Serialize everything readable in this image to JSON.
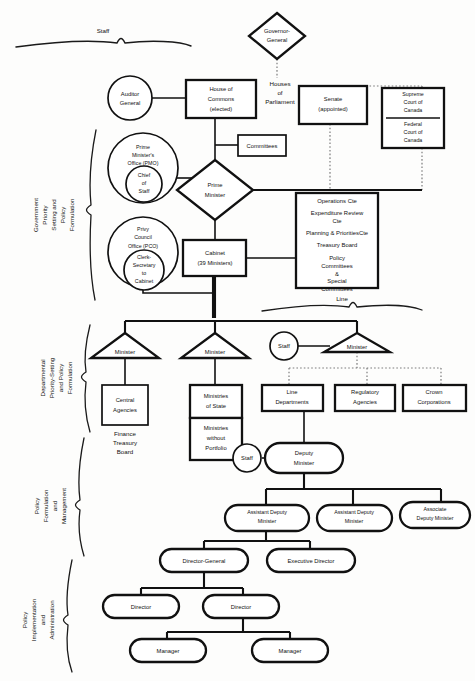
{
  "diagram": {
    "brace_labels": {
      "staff": "Staff",
      "line": "Line"
    },
    "side_labels": [
      {
        "id": "government-priority",
        "lines": [
          "Government",
          "Priority",
          "Setting and",
          "Policy",
          "Formulation"
        ]
      },
      {
        "id": "departmental-priority",
        "lines": [
          "Departmental",
          "Priority-Setting",
          "and Policy",
          "Formulation"
        ]
      },
      {
        "id": "policy-formulation-management",
        "lines": [
          "Policy",
          "Formulation",
          "and",
          "Management"
        ]
      },
      {
        "id": "policy-implementation-administration",
        "lines": [
          "Policy",
          "Implementation",
          "and",
          "Administration"
        ]
      }
    ],
    "free_labels": [
      {
        "id": "houses-of-parliament",
        "lines": [
          "Houses",
          "of",
          "Parliament"
        ]
      },
      {
        "id": "finance-treasury-board",
        "lines": [
          "Finance",
          "Treasury",
          "Board"
        ]
      }
    ],
    "nodes": [
      {
        "id": "governor-general",
        "shape": "diamond",
        "lines": [
          "Governor-",
          "General"
        ]
      },
      {
        "id": "auditor-general",
        "shape": "circle",
        "lines": [
          "Auditor",
          "General"
        ]
      },
      {
        "id": "house-of-commons",
        "shape": "rect",
        "lines": [
          "House of",
          "Commons",
          "(elected)"
        ]
      },
      {
        "id": "senate",
        "shape": "rect",
        "lines": [
          "Senate",
          "(appointed)"
        ]
      },
      {
        "id": "supreme-court",
        "shape": "rect",
        "lines": [
          "Supreme",
          "Court of",
          "Canada"
        ]
      },
      {
        "id": "federal-court",
        "shape": "rect",
        "lines": [
          "Federal",
          "Court of",
          "Canada"
        ]
      },
      {
        "id": "pmo",
        "shape": "circle",
        "lines": [
          "Prime",
          "Minister's",
          "Office (PMO)"
        ]
      },
      {
        "id": "chief-of-staff",
        "shape": "circle",
        "lines": [
          "Chief",
          "of",
          "Staff"
        ]
      },
      {
        "id": "committees",
        "shape": "rect",
        "lines": [
          "Committees"
        ]
      },
      {
        "id": "prime-minister",
        "shape": "diamond",
        "lines": [
          "Prime",
          "Minister"
        ]
      },
      {
        "id": "pco",
        "shape": "circle",
        "lines": [
          "Privy",
          "Council",
          "Office (PCO)"
        ]
      },
      {
        "id": "clerk-secretary",
        "shape": "circle",
        "lines": [
          "Clerk-",
          "Secretary",
          "to",
          "Cabinet"
        ]
      },
      {
        "id": "cabinet",
        "shape": "rect",
        "lines": [
          "Cabinet",
          "(39 Ministers)"
        ]
      },
      {
        "id": "cabinet-committees",
        "shape": "rect",
        "lines": [
          "Operations Cte",
          "Expenditure Review",
          "Cte",
          "Planning & PrioritiesCte",
          "Treasury Board",
          "",
          "Policy",
          "Committees",
          "&",
          "Special",
          "Committees"
        ]
      },
      {
        "id": "minister-central",
        "shape": "triangle",
        "lines": [
          "Minister"
        ]
      },
      {
        "id": "minister-state",
        "shape": "triangle",
        "lines": [
          "Minister"
        ]
      },
      {
        "id": "minister-line",
        "shape": "triangle",
        "lines": [
          "Minister"
        ]
      },
      {
        "id": "staff-minister",
        "shape": "circle",
        "lines": [
          "Staff"
        ]
      },
      {
        "id": "central-agencies",
        "shape": "rect",
        "lines": [
          "Central",
          "Agencies"
        ]
      },
      {
        "id": "ministries-of-state",
        "shape": "rect",
        "lines": [
          "Ministries",
          "of State"
        ]
      },
      {
        "id": "ministries-without-portfolio",
        "shape": "rect",
        "lines": [
          "Ministries",
          "without",
          "Portfolio"
        ]
      },
      {
        "id": "line-departments",
        "shape": "rect",
        "lines": [
          "Line",
          "Departments"
        ]
      },
      {
        "id": "regulatory-agencies",
        "shape": "rect",
        "lines": [
          "Regulatory",
          "Agencies"
        ]
      },
      {
        "id": "crown-corporations",
        "shape": "rect",
        "lines": [
          "Crown",
          "Corporations"
        ]
      },
      {
        "id": "staff-deputy",
        "shape": "circle",
        "lines": [
          "Staff"
        ]
      },
      {
        "id": "deputy-minister",
        "shape": "stadium",
        "lines": [
          "Deputy",
          "Minister"
        ]
      },
      {
        "id": "assistant-deputy-minister-1",
        "shape": "stadium",
        "lines": [
          "Assistant Deputy",
          "Minister"
        ]
      },
      {
        "id": "assistant-deputy-minister-2",
        "shape": "stadium",
        "lines": [
          "Assistant Deputy",
          "Minister"
        ]
      },
      {
        "id": "associate-deputy-minister",
        "shape": "stadium",
        "lines": [
          "Associate",
          "Deputy Minister"
        ]
      },
      {
        "id": "director-general",
        "shape": "stadium",
        "lines": [
          "Director-General"
        ]
      },
      {
        "id": "executive-director",
        "shape": "stadium",
        "lines": [
          "Executive Director"
        ]
      },
      {
        "id": "director-1",
        "shape": "stadium",
        "lines": [
          "Director"
        ]
      },
      {
        "id": "director-2",
        "shape": "stadium",
        "lines": [
          "Director"
        ]
      },
      {
        "id": "manager-1",
        "shape": "stadium",
        "lines": [
          "Manager"
        ]
      },
      {
        "id": "manager-2",
        "shape": "stadium",
        "lines": [
          "Manager"
        ]
      }
    ]
  }
}
